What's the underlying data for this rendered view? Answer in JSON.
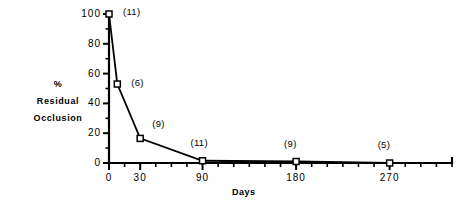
{
  "chart_data": {
    "type": "line",
    "title": "",
    "xlabel": "Days",
    "ylabel": "% Residual Occlusion",
    "ylabel_lines": [
      "%",
      "Residual",
      "Occlusion"
    ],
    "xlim": [
      0,
      330
    ],
    "ylim": [
      0,
      100
    ],
    "grid": false,
    "legend": "none",
    "marker": "open-square",
    "line_color": "#000000",
    "background_color": "#ffffff",
    "x": [
      0,
      8,
      30,
      90,
      180,
      270
    ],
    "values": [
      100,
      53,
      16.5,
      1.5,
      1.0,
      0.0
    ],
    "point_labels": [
      "(11)",
      "(6)",
      "(9)",
      "(11)",
      "(9)",
      "(5)"
    ],
    "xticks": [
      0,
      30,
      90,
      180,
      270
    ],
    "xtick_labels": [
      "0",
      "30",
      "90",
      "180",
      "270"
    ],
    "xminor_step": 15,
    "yticks": [
      0,
      20,
      40,
      60,
      80,
      100
    ],
    "ytick_labels": [
      "0",
      "20",
      "40",
      "60",
      "80",
      "100"
    ],
    "yminor_step": 10
  }
}
